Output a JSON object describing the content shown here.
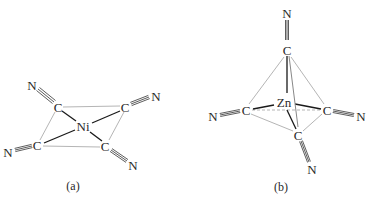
{
  "figure": {
    "panel_a": {
      "label": "(a)",
      "center_atom": "Ni",
      "geometry": "square planar",
      "ligand_atom_c": "C",
      "ligand_atom_n": "N",
      "ligand_count": 4
    },
    "panel_b": {
      "label": "(b)",
      "center_atom": "Zn",
      "geometry": "tetrahedral",
      "ligand_atom_c": "C",
      "ligand_atom_n": "N",
      "ligand_count": 4
    }
  }
}
